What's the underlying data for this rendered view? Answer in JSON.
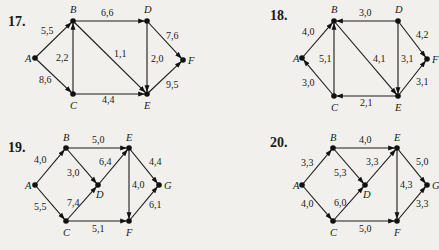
{
  "problems": [
    {
      "number": "17.",
      "numPos": [
        8,
        26
      ],
      "nodes": [
        {
          "id": "A",
          "x": 35,
          "y": 58,
          "lx": -10,
          "ly": 4
        },
        {
          "id": "B",
          "x": 73,
          "y": 21,
          "lx": -3,
          "ly": -8
        },
        {
          "id": "C",
          "x": 73,
          "y": 94,
          "lx": -3,
          "ly": 15
        },
        {
          "id": "D",
          "x": 147,
          "y": 21,
          "lx": -3,
          "ly": -8
        },
        {
          "id": "E",
          "x": 147,
          "y": 94,
          "lx": -3,
          "ly": 15
        },
        {
          "id": "F",
          "x": 183,
          "y": 60,
          "lx": 5,
          "ly": 4
        }
      ],
      "edges": [
        {
          "from": "A",
          "to": "B",
          "label": "5,5",
          "lx": 41,
          "ly": 34
        },
        {
          "from": "A",
          "to": "C",
          "label": "8,6",
          "lx": 39,
          "ly": 83
        },
        {
          "from": "C",
          "to": "B",
          "label": "2,2",
          "lx": 56,
          "ly": 61
        },
        {
          "from": "B",
          "to": "D",
          "label": "6,6",
          "lx": 101,
          "ly": 16
        },
        {
          "from": "B",
          "to": "E",
          "label": "1,1",
          "lx": 114,
          "ly": 57
        },
        {
          "from": "D",
          "to": "E",
          "label": "2,0",
          "lx": 151,
          "ly": 62
        },
        {
          "from": "C",
          "to": "E",
          "label": "4,4",
          "lx": 102,
          "ly": 103
        },
        {
          "from": "D",
          "to": "F",
          "label": "7,6",
          "lx": 166,
          "ly": 39
        },
        {
          "from": "E",
          "to": "F",
          "label": "9,5",
          "lx": 166,
          "ly": 88
        }
      ]
    },
    {
      "number": "18.",
      "numPos": [
        270,
        20
      ],
      "nodes": [
        {
          "id": "A",
          "x": 302,
          "y": 58,
          "lx": -9,
          "ly": 4
        },
        {
          "id": "B",
          "x": 334,
          "y": 21,
          "lx": -3,
          "ly": -8
        },
        {
          "id": "C",
          "x": 334,
          "y": 96,
          "lx": -3,
          "ly": 15
        },
        {
          "id": "D",
          "x": 398,
          "y": 21,
          "lx": -3,
          "ly": -8
        },
        {
          "id": "E",
          "x": 398,
          "y": 96,
          "lx": -3,
          "ly": 15
        },
        {
          "id": "F",
          "x": 427,
          "y": 59,
          "lx": 5,
          "ly": 4
        }
      ],
      "edges": [
        {
          "from": "A",
          "to": "B",
          "label": "4,0",
          "lx": 302,
          "ly": 35
        },
        {
          "from": "C",
          "to": "A",
          "label": "3,0",
          "lx": 302,
          "ly": 86
        },
        {
          "from": "C",
          "to": "B",
          "label": "5,1",
          "lx": 319,
          "ly": 62
        },
        {
          "from": "D",
          "to": "B",
          "label": "3,0",
          "lx": 359,
          "ly": 16
        },
        {
          "from": "B",
          "to": "E",
          "label": "4,1",
          "lx": 373,
          "ly": 62
        },
        {
          "from": "D",
          "to": "E",
          "label": "3,1",
          "lx": 401,
          "ly": 62
        },
        {
          "from": "E",
          "to": "C",
          "label": "2,1",
          "lx": 360,
          "ly": 106
        },
        {
          "from": "D",
          "to": "F",
          "label": "4,2",
          "lx": 416,
          "ly": 38
        },
        {
          "from": "E",
          "to": "F",
          "label": "3,1",
          "lx": 416,
          "ly": 85
        }
      ]
    },
    {
      "number": "19.",
      "numPos": [
        8,
        152
      ],
      "nodes": [
        {
          "id": "A",
          "x": 35,
          "y": 185,
          "lx": -10,
          "ly": 4
        },
        {
          "id": "B",
          "x": 66,
          "y": 148,
          "lx": -3,
          "ly": -7
        },
        {
          "id": "C",
          "x": 66,
          "y": 221,
          "lx": -3,
          "ly": 15
        },
        {
          "id": "D",
          "x": 98,
          "y": 185,
          "lx": -2,
          "ly": 13
        },
        {
          "id": "E",
          "x": 129,
          "y": 148,
          "lx": -3,
          "ly": -7
        },
        {
          "id": "F",
          "x": 129,
          "y": 221,
          "lx": -3,
          "ly": 15
        },
        {
          "id": "G",
          "x": 159,
          "y": 185,
          "lx": 5,
          "ly": 4
        }
      ],
      "edges": [
        {
          "from": "A",
          "to": "B",
          "label": "4,0",
          "lx": 34,
          "ly": 163
        },
        {
          "from": "A",
          "to": "C",
          "label": "5,5",
          "lx": 34,
          "ly": 210
        },
        {
          "from": "B",
          "to": "E",
          "label": "5,0",
          "lx": 92,
          "ly": 143
        },
        {
          "from": "B",
          "to": "D",
          "label": "3,0",
          "lx": 67,
          "ly": 176
        },
        {
          "from": "C",
          "to": "D",
          "label": "7,4",
          "lx": 67,
          "ly": 206
        },
        {
          "from": "D",
          "to": "E",
          "label": "6,4",
          "lx": 99,
          "ly": 165
        },
        {
          "from": "C",
          "to": "F",
          "label": "5,1",
          "lx": 92,
          "ly": 232
        },
        {
          "from": "E",
          "to": "F",
          "label": "4,0",
          "lx": 132,
          "ly": 188
        },
        {
          "from": "E",
          "to": "G",
          "label": "4,4",
          "lx": 149,
          "ly": 165
        },
        {
          "from": "F",
          "to": "G",
          "label": "6,1",
          "lx": 149,
          "ly": 208
        }
      ]
    },
    {
      "number": "20.",
      "numPos": [
        270,
        147
      ],
      "nodes": [
        {
          "id": "A",
          "x": 302,
          "y": 185,
          "lx": -9,
          "ly": 4
        },
        {
          "id": "B",
          "x": 333,
          "y": 148,
          "lx": -3,
          "ly": -7
        },
        {
          "id": "C",
          "x": 333,
          "y": 221,
          "lx": -3,
          "ly": 15
        },
        {
          "id": "D",
          "x": 365,
          "y": 185,
          "lx": -2,
          "ly": 13
        },
        {
          "id": "E",
          "x": 397,
          "y": 148,
          "lx": -3,
          "ly": -7
        },
        {
          "id": "F",
          "x": 397,
          "y": 221,
          "lx": -3,
          "ly": 15
        },
        {
          "id": "G",
          "x": 427,
          "y": 185,
          "lx": 5,
          "ly": 4
        }
      ],
      "edges": [
        {
          "from": "A",
          "to": "B",
          "label": "3,3",
          "lx": 301,
          "ly": 166
        },
        {
          "from": "A",
          "to": "C",
          "label": "4,0",
          "lx": 301,
          "ly": 207
        },
        {
          "from": "B",
          "to": "E",
          "label": "4,0",
          "lx": 359,
          "ly": 143
        },
        {
          "from": "B",
          "to": "D",
          "label": "5,3",
          "lx": 334,
          "ly": 176
        },
        {
          "from": "C",
          "to": "D",
          "label": "6,0",
          "lx": 334,
          "ly": 206
        },
        {
          "from": "D",
          "to": "E",
          "label": "3,3",
          "lx": 366,
          "ly": 165
        },
        {
          "from": "C",
          "to": "F",
          "label": "5,0",
          "lx": 359,
          "ly": 232
        },
        {
          "from": "E",
          "to": "F",
          "label": "4,3",
          "lx": 400,
          "ly": 188
        },
        {
          "from": "E",
          "to": "G",
          "label": "5,0",
          "lx": 416,
          "ly": 165
        },
        {
          "from": "F",
          "to": "G",
          "label": "3,3",
          "lx": 416,
          "ly": 207
        }
      ]
    }
  ]
}
